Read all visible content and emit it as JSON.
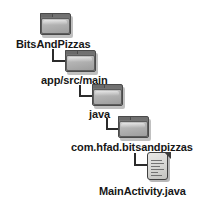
{
  "diagram": {
    "type": "tree",
    "background_color": "#ffffff",
    "text_color": "#171717",
    "connector_color": "#2b2b2b",
    "folder_color": "#b5b5b5",
    "nodes": [
      {
        "label": "BitsAndPizzas",
        "icon": "folder-icon",
        "depth": 0,
        "icon_x": 40,
        "icon_y": 13,
        "label_x": 16,
        "label_y": 38
      },
      {
        "label": "app/src/main",
        "icon": "folder-icon",
        "depth": 1,
        "icon_x": 65,
        "icon_y": 50,
        "label_x": 41,
        "label_y": 74
      },
      {
        "label": "java",
        "icon": "folder-icon",
        "depth": 2,
        "icon_x": 92,
        "icon_y": 84,
        "label_x": 89,
        "label_y": 108
      },
      {
        "label": "com.hfad.bitsandpizzas",
        "icon": "folder-icon",
        "depth": 3,
        "icon_x": 118,
        "icon_y": 116,
        "label_x": 71,
        "label_y": 141
      },
      {
        "label": "MainActivity.java",
        "icon": "file-icon",
        "depth": 4,
        "icon_x": 147,
        "icon_y": 152,
        "label_x": 99,
        "label_y": 185
      }
    ],
    "connectors": [
      {
        "from": "BitsAndPizzas",
        "to": "app/src/main",
        "x": 52,
        "y": 49,
        "width": 13,
        "height": 13
      },
      {
        "from": "app/src/main",
        "to": "java",
        "x": 79,
        "y": 85,
        "width": 13,
        "height": 12
      },
      {
        "from": "java",
        "to": "com.hfad.bitsandpizzas",
        "x": 106,
        "y": 118,
        "width": 12,
        "height": 12
      },
      {
        "from": "com.hfad.bitsandpizzas",
        "to": "MainActivity.java",
        "x": 134,
        "y": 153,
        "width": 13,
        "height": 13
      }
    ]
  }
}
